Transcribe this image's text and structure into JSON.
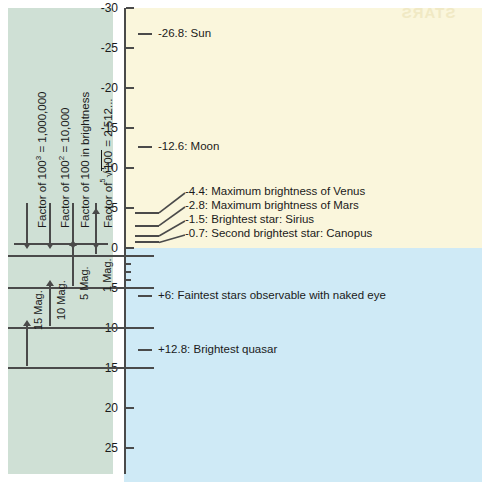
{
  "figure": {
    "showthrough_text": "STARS",
    "colors": {
      "panel_green": "#cfe0d5",
      "region_bright": "#faf6dc",
      "region_faint": "#cfeaf6",
      "ink": "#4a4a4a",
      "text": "#1a1a1a"
    }
  },
  "axis": {
    "label": "Apparent magnitude",
    "major_ticks": [
      "-30",
      "-25",
      "-20",
      "-15",
      "-10",
      "-5",
      "0",
      "5",
      "10",
      "15",
      "20",
      "25",
      "30"
    ],
    "minor_ticks": [
      1,
      2,
      3,
      4
    ],
    "range": [
      -32,
      30
    ],
    "orientation": "vertical-inverted"
  },
  "left_panel": {
    "factor_labels": [
      {
        "text": "Factor of 100",
        "sup": "3",
        "tail": " = 1,000,000"
      },
      {
        "text": "Factor of 100",
        "sup": "2",
        "tail": " = 10,000"
      },
      {
        "text": "Factor of 100 in brightness",
        "sup": "",
        "tail": ""
      },
      {
        "text": "Factor of",
        "sup": "",
        "tail": " = 2.512..."
      }
    ],
    "radical_index": "5",
    "radical_body": "100",
    "span_labels": [
      "15 Mag.",
      "10 Mag.",
      "5 Mag.",
      "1 Mag."
    ]
  },
  "chart_data": {
    "type": "scatter",
    "ylabel": "Apparent magnitude",
    "xlabel": "",
    "ylim": [
      -32,
      30
    ],
    "grid": false,
    "legend": "none",
    "annotations": [
      {
        "magnitude": -26.8,
        "label": "-26.8: Sun",
        "region": "bright"
      },
      {
        "magnitude": -12.6,
        "label": "-12.6: Moon",
        "region": "bright"
      },
      {
        "magnitude": -4.4,
        "label": "-4.4: Maximum brightness of Venus",
        "region": "bright"
      },
      {
        "magnitude": -2.8,
        "label": "-2.8: Maximum brightness of Mars",
        "region": "bright"
      },
      {
        "magnitude": -1.5,
        "label": "-1.5: Brightest star: Sirius",
        "region": "bright"
      },
      {
        "magnitude": -0.7,
        "label": "-0.7: Second brightest star: Canopus",
        "region": "bright"
      },
      {
        "magnitude": 6,
        "label": "+6: Faintest stars observable with naked eye",
        "region": "faint"
      },
      {
        "magnitude": 12.8,
        "label": "+12.8: Brightest quasar",
        "region": "faint"
      },
      {
        "magnitude": 30,
        "label": "+30: Faintest objects observable with Hubble Space Telescope",
        "region": "faint"
      }
    ],
    "magnitude_spans": [
      {
        "label": "15 Mag.",
        "from": 0,
        "to": 15,
        "factor": "Factor of 100^3 = 1,000,000"
      },
      {
        "label": "10 Mag.",
        "from": 0,
        "to": 10,
        "factor": "Factor of 100^2 = 10,000"
      },
      {
        "label": "5 Mag.",
        "from": 0,
        "to": 5,
        "factor": "Factor of 100 in brightness"
      },
      {
        "label": "1 Mag.",
        "from": 0,
        "to": 1,
        "factor": "Factor of 5th-root(100) = 2.512..."
      }
    ]
  }
}
